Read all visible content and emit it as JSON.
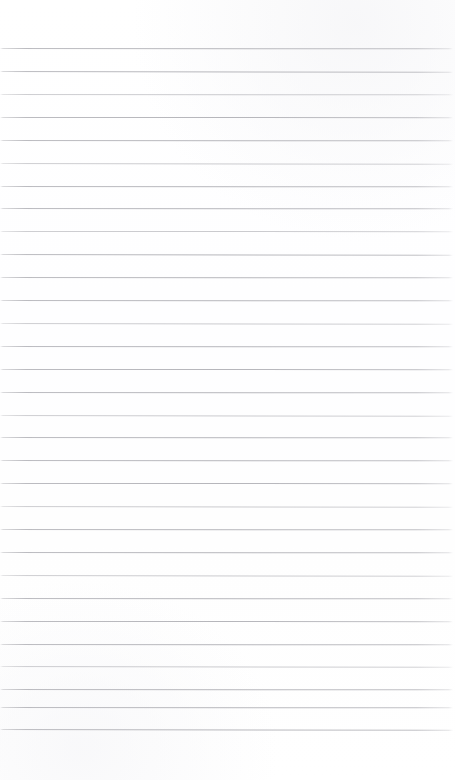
{
  "document": {
    "kind": "ruled-paper-scan",
    "description": "Blank lined notebook paper",
    "width_px": 455,
    "height_px": 780,
    "has_text": false,
    "has_margin_rule": false,
    "header_text": "",
    "body_text": ""
  },
  "paper": {
    "background_color": "#fefefe",
    "edge_color": "#ffffff"
  },
  "rules": {
    "color": "#bcbcc0",
    "thickness_px": 1,
    "spacing_px": 22.9,
    "first_line_y": 48,
    "last_line_y": 729,
    "count": 30,
    "left_x": 0,
    "right_x": 453,
    "lines": [
      {
        "y": 48.0,
        "weight": "heavy",
        "tilt": "tilt-a"
      },
      {
        "y": 71.0,
        "weight": "heavy",
        "tilt": "tilt-b"
      },
      {
        "y": 93.9,
        "weight": "light",
        "tilt": "tilt-a"
      },
      {
        "y": 116.8,
        "weight": "heavy",
        "tilt": "tilt-c"
      },
      {
        "y": 139.7,
        "weight": "heavy",
        "tilt": "tilt-a"
      },
      {
        "y": 162.6,
        "weight": "light",
        "tilt": "tilt-b"
      },
      {
        "y": 185.5,
        "weight": "heavy",
        "tilt": "tilt-a"
      },
      {
        "y": 208.4,
        "weight": "heavy",
        "tilt": "tilt-a"
      },
      {
        "y": 231.3,
        "weight": "light",
        "tilt": "tilt-c"
      },
      {
        "y": 254.2,
        "weight": "heavy",
        "tilt": "tilt-b"
      },
      {
        "y": 277.1,
        "weight": "heavy",
        "tilt": "tilt-a"
      },
      {
        "y": 300.0,
        "weight": "heavy",
        "tilt": "tilt-a"
      },
      {
        "y": 322.9,
        "weight": "light",
        "tilt": "tilt-b"
      },
      {
        "y": 345.8,
        "weight": "heavy",
        "tilt": "tilt-a"
      },
      {
        "y": 368.7,
        "weight": "heavy",
        "tilt": "tilt-c"
      },
      {
        "y": 391.6,
        "weight": "heavy",
        "tilt": "tilt-a"
      },
      {
        "y": 414.5,
        "weight": "light",
        "tilt": "tilt-b"
      },
      {
        "y": 437.4,
        "weight": "heavy",
        "tilt": "tilt-a"
      },
      {
        "y": 460.3,
        "weight": "heavy",
        "tilt": "tilt-a"
      },
      {
        "y": 483.2,
        "weight": "heavy",
        "tilt": "tilt-c"
      },
      {
        "y": 506.1,
        "weight": "light",
        "tilt": "tilt-b"
      },
      {
        "y": 529.0,
        "weight": "heavy",
        "tilt": "tilt-a"
      },
      {
        "y": 551.9,
        "weight": "heavy",
        "tilt": "tilt-a"
      },
      {
        "y": 574.8,
        "weight": "light",
        "tilt": "tilt-b"
      },
      {
        "y": 597.7,
        "weight": "heavy",
        "tilt": "tilt-a"
      },
      {
        "y": 620.6,
        "weight": "heavy",
        "tilt": "tilt-c"
      },
      {
        "y": 643.5,
        "weight": "heavy",
        "tilt": "tilt-a"
      },
      {
        "y": 666.4,
        "weight": "light",
        "tilt": "tilt-b"
      },
      {
        "y": 689.3,
        "weight": "heavy",
        "tilt": "tilt-a"
      },
      {
        "y": 706.5,
        "weight": "heavy",
        "tilt": "tilt-a"
      },
      {
        "y": 729.0,
        "weight": "heavy",
        "tilt": "tilt-b"
      }
    ]
  },
  "margins": {
    "top_height_px": 48,
    "bottom_height_px": 51
  }
}
